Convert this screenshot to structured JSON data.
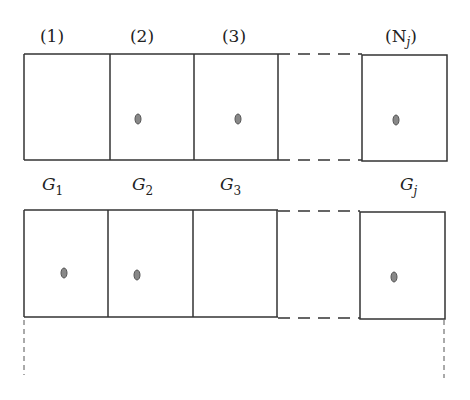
{
  "diagram": {
    "top_labels": [
      "(1)",
      "(2)",
      "(3)",
      "(N",
      "j",
      ")"
    ],
    "group_labels": {
      "g1": {
        "base": "G",
        "sub": "1"
      },
      "g2": {
        "base": "G",
        "sub": "2"
      },
      "g3": {
        "base": "G",
        "sub": "3"
      },
      "gj": {
        "base": "G",
        "sub": "j"
      }
    },
    "rows": [
      {
        "name": "row-1",
        "cells_with_particle": [
          2,
          3,
          "Nj"
        ]
      },
      {
        "name": "row-2",
        "cells_with_particle": [
          1,
          2,
          "Nj"
        ]
      }
    ],
    "colors": {
      "line": "#333333",
      "particle": "#888888"
    }
  }
}
